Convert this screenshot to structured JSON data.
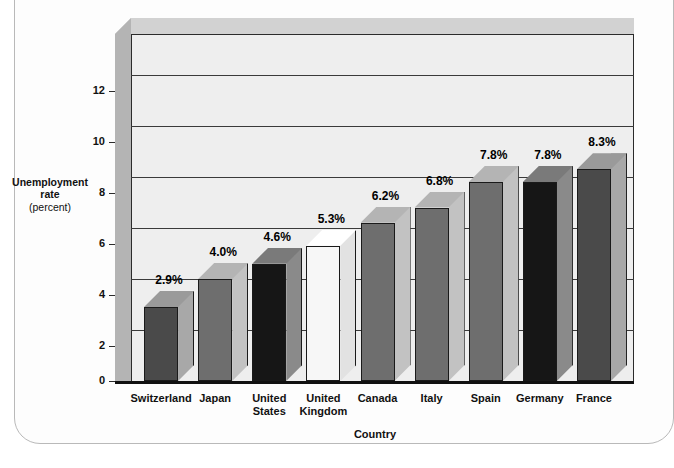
{
  "figure": {
    "y_axis_title_main": "Unemployment\nrate",
    "y_axis_title_sub": "(percent)",
    "x_axis_title": "Country"
  },
  "chart_data": {
    "type": "bar",
    "title": "",
    "subtitle": "",
    "xlabel": "Country",
    "ylabel": "Unemployment rate (percent)",
    "ylim": [
      0,
      13.6
    ],
    "yticks": [
      0,
      2,
      4,
      6,
      8,
      10,
      12
    ],
    "ytick_labels": [
      "0",
      "2",
      "4",
      "6",
      "8",
      "10",
      "12"
    ],
    "grid": true,
    "legend": "none",
    "three_d": true,
    "categories": [
      "Switzerland",
      "Japan",
      "United States",
      "United Kingdom",
      "Canada",
      "Italy",
      "Spain",
      "Germany",
      "France"
    ],
    "category_label_lines": [
      "Switzerland",
      "Japan",
      "United\nStates",
      "United\nKingdom",
      "Canada",
      "Italy",
      "Spain",
      "Germany",
      "France"
    ],
    "values": [
      2.9,
      4.0,
      4.6,
      5.3,
      6.2,
      6.8,
      7.8,
      7.8,
      8.3
    ],
    "data_labels": [
      "2.9%",
      "4.0%",
      "4.6%",
      "5.3%",
      "6.2%",
      "6.8%",
      "7.8%",
      "7.8%",
      "8.3%"
    ],
    "bar_colors": [
      "#4a4a4a",
      "#6e6e6e",
      "#161616",
      "#f7f7f7",
      "#6e6e6e",
      "#6e6e6e",
      "#6e6e6e",
      "#161616",
      "#4a4a4a"
    ],
    "bar_side_colors": [
      "#a8a8a8",
      "#c2c2c2",
      "#8a8a8a",
      "#e2e2e2",
      "#c2c2c2",
      "#c2c2c2",
      "#c2c2c2",
      "#8a8a8a",
      "#a8a8a8"
    ],
    "bar_top_colors": [
      "#9a9a9a",
      "#b4b4b4",
      "#7a7a7a",
      "#ffffff",
      "#b4b4b4",
      "#b4b4b4",
      "#b4b4b4",
      "#7a7a7a",
      "#9a9a9a"
    ]
  },
  "colors": {
    "plot_background": "#eeeeee",
    "wall_top": "#d2d2d2",
    "wall_left": "#b4b4b4",
    "axis": "#2b2b2b",
    "text": "#111111",
    "page_background": "#ffffff",
    "frame_border": "#b9b9b9"
  }
}
